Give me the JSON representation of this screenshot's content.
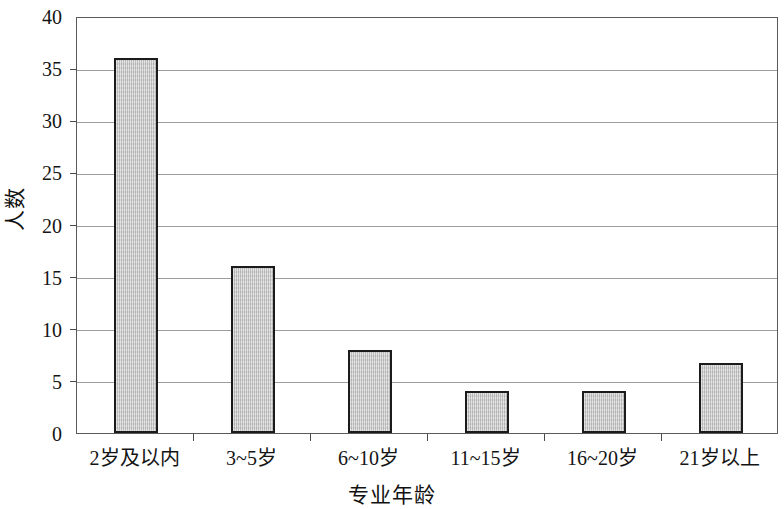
{
  "chart_data": {
    "type": "bar",
    "title": "",
    "xlabel": "专业年龄",
    "ylabel": "人数",
    "categories": [
      "2岁及以内",
      "3~5岁",
      "6~10岁",
      "11~15岁",
      "16~20岁",
      "21岁以上"
    ],
    "values": [
      36,
      16,
      8,
      4,
      4,
      6.7
    ],
    "ylim": [
      0,
      40
    ],
    "yticks": [
      0,
      5,
      10,
      15,
      20,
      25,
      30,
      35,
      40
    ],
    "ytick_labels": [
      "0",
      "5",
      "10",
      "15",
      "20",
      "25",
      "30",
      "35",
      "40"
    ],
    "grid": true,
    "legend": false,
    "series": [
      {
        "name": "人数",
        "values": [
          36,
          16,
          8,
          4,
          4,
          6.7
        ]
      }
    ],
    "colors": {
      "bar_fill": "#c9c9c9",
      "bar_border": "#1b1b1b",
      "gridline": "#9d9d9d",
      "axis": "#5a5a5a",
      "text": "#141414"
    }
  }
}
